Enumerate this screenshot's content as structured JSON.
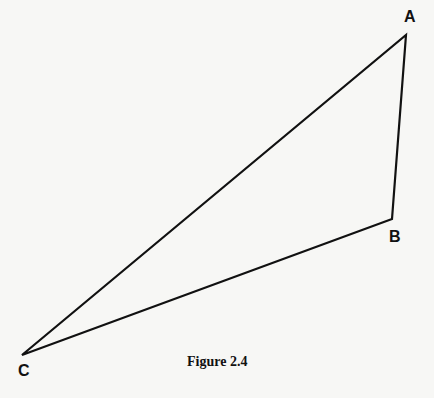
{
  "figure": {
    "caption": "Figure 2.4",
    "type": "triangle",
    "vertices": [
      {
        "label": "A",
        "x": 406,
        "y": 35
      },
      {
        "label": "B",
        "x": 392,
        "y": 219
      },
      {
        "label": "C",
        "x": 22,
        "y": 355
      }
    ],
    "stroke_color": "#111111"
  }
}
